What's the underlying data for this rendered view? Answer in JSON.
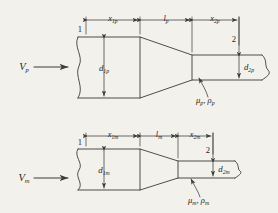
{
  "figure": {
    "type": "engineering-diagram",
    "background_color": "#f3f1ec",
    "line_color": "#3b3b3b",
    "panels": [
      {
        "id": "prototype",
        "subscript": "p",
        "velocity_label": "V",
        "velocity_sub": "p",
        "inlet_diameter_label": "d",
        "inlet_diameter_sub": "1p",
        "outlet_diameter_label": "d",
        "outlet_diameter_sub": "2p",
        "length_inlet_label": "x",
        "length_inlet_sub": "1p",
        "length_cone_label": "l",
        "length_cone_sub": "p",
        "length_outlet_label": "x",
        "length_outlet_sub": "2p",
        "section_1": "1",
        "section_2": "2",
        "fluid_props": "μ",
        "fluid_props_sub_1": "p",
        "fluid_props_2": "ρ",
        "fluid_props_sub_2": "p",
        "fluid_props_full": "μₚ, ρₚ"
      },
      {
        "id": "model",
        "subscript": "m",
        "velocity_label": "V",
        "velocity_sub": "m",
        "inlet_diameter_label": "d",
        "inlet_diameter_sub": "1m",
        "outlet_diameter_label": "d",
        "outlet_diameter_sub": "2m",
        "length_inlet_label": "x",
        "length_inlet_sub": "1m",
        "length_cone_label": "l",
        "length_cone_sub": "m",
        "length_outlet_label": "x",
        "length_outlet_sub": "2m",
        "section_1": "1",
        "section_2": "2",
        "fluid_props": "μ",
        "fluid_props_sub_1": "m",
        "fluid_props_2": "ρ",
        "fluid_props_sub_2": "m",
        "fluid_props_full": "μₘ, ρₘ"
      }
    ]
  }
}
